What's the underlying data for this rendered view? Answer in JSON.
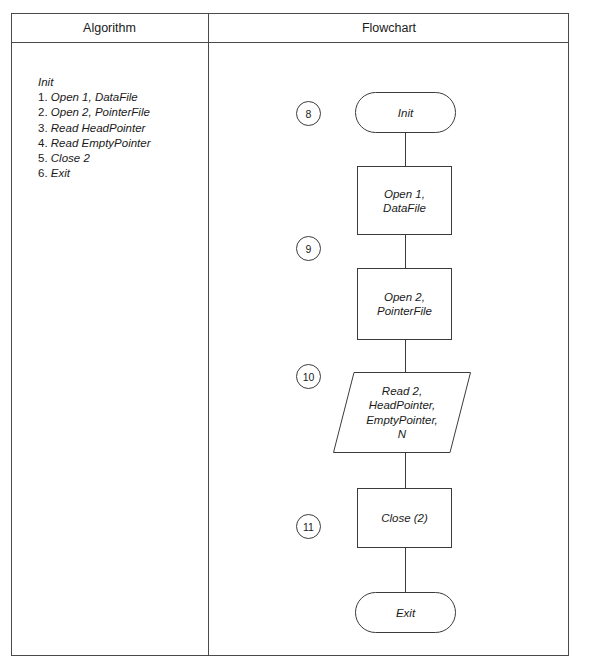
{
  "figure": {
    "columns": {
      "algorithm_header": "Algorithm",
      "flowchart_header": "Flowchart"
    }
  },
  "algorithm": {
    "title": "Init",
    "steps": [
      {
        "num": "1.",
        "text": "Open",
        "tail": " 1, ",
        "tail2": "DataFile"
      },
      {
        "num": "2.",
        "text": "Open",
        "tail": " 2, ",
        "tail2": "PointerFile"
      },
      {
        "num": "3.",
        "text": "Read",
        "tail": " ",
        "tail2": "HeadPointer"
      },
      {
        "num": "4.",
        "text": "Read",
        "tail": " ",
        "tail2": "EmptyPointer"
      },
      {
        "num": "5.",
        "text": "Close",
        "tail": "  2",
        "tail2": ""
      },
      {
        "num": "6.",
        "text": "Exit",
        "tail": "",
        "tail2": ""
      }
    ],
    "lines": [
      "Init",
      "1. Open 1, DataFile",
      "2. Open 2, PointerFile",
      "3. Read HeadPointer",
      "4. Read EmptyPointer",
      "5. Close  2",
      "6. Exit"
    ]
  },
  "flowchart": {
    "nodes": [
      {
        "id": "init",
        "shape": "terminal",
        "label": "Init",
        "step": "8"
      },
      {
        "id": "open1",
        "shape": "process",
        "label": "Open 1,\nDataFile",
        "step": "9"
      },
      {
        "id": "open2",
        "shape": "process",
        "label": "Open 2,\nPointerFile",
        "step": ""
      },
      {
        "id": "read",
        "shape": "io",
        "label": "Read 2,\nHeadPointer,\nEmptyPointer,\nN",
        "step": "10"
      },
      {
        "id": "close",
        "shape": "process",
        "label": "Close (2)",
        "step": "11"
      },
      {
        "id": "exit",
        "shape": "terminal",
        "label": "Exit",
        "step": ""
      }
    ],
    "node_labels": {
      "init": "Init",
      "open1_line1": "Open 1,",
      "open1_line2": "DataFile",
      "open2_line1": "Open 2,",
      "open2_line2": "PointerFile",
      "read_line1": "Read 2,",
      "read_line2": "HeadPointer,",
      "read_line3": "EmptyPointer,",
      "read_line4": "N",
      "close": "Close (2)",
      "exit": "Exit"
    },
    "step_numbers": {
      "init": "8",
      "open1": "9",
      "read": "10",
      "close": "11"
    }
  },
  "colors": {
    "border": "#3b3b3b",
    "frame": "#4a4a4a",
    "text": "#1a1a1a",
    "background": "#ffffff"
  }
}
